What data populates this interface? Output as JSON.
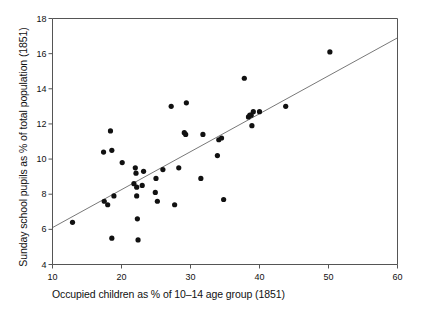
{
  "chart_data": {
    "type": "scatter",
    "title": "",
    "xlabel": "Occupied children as % of 10–14 age group (1851)",
    "ylabel": "Sunday school pupils as % of total population (1851)",
    "xlim": [
      10,
      60
    ],
    "ylim": [
      4,
      18
    ],
    "xticks": [
      10,
      20,
      30,
      40,
      50,
      60
    ],
    "yticks": [
      4,
      6,
      8,
      10,
      12,
      14,
      16,
      18
    ],
    "xticklabels": [
      "10",
      "20",
      "30",
      "40",
      "50",
      "60"
    ],
    "yticklabels": [
      "4",
      "6",
      "8",
      "10",
      "12",
      "14",
      "16",
      "18"
    ],
    "grid": false,
    "legend": null,
    "marker": "filled-circle",
    "marker_color": "#111111",
    "points": [
      {
        "x": 12.9,
        "y": 6.4
      },
      {
        "x": 17.4,
        "y": 10.4
      },
      {
        "x": 17.5,
        "y": 7.6
      },
      {
        "x": 18.0,
        "y": 7.4
      },
      {
        "x": 18.4,
        "y": 11.6
      },
      {
        "x": 18.6,
        "y": 10.5
      },
      {
        "x": 18.6,
        "y": 5.5
      },
      {
        "x": 18.9,
        "y": 7.9
      },
      {
        "x": 20.1,
        "y": 9.8
      },
      {
        "x": 21.8,
        "y": 8.6
      },
      {
        "x": 22.0,
        "y": 9.5
      },
      {
        "x": 22.1,
        "y": 9.2
      },
      {
        "x": 22.2,
        "y": 8.4
      },
      {
        "x": 22.2,
        "y": 7.9
      },
      {
        "x": 22.3,
        "y": 6.6
      },
      {
        "x": 22.4,
        "y": 5.4
      },
      {
        "x": 23.0,
        "y": 8.5
      },
      {
        "x": 23.2,
        "y": 9.3
      },
      {
        "x": 24.9,
        "y": 8.1
      },
      {
        "x": 25.0,
        "y": 8.9
      },
      {
        "x": 25.2,
        "y": 7.6
      },
      {
        "x": 26.0,
        "y": 9.4
      },
      {
        "x": 27.2,
        "y": 13.0
      },
      {
        "x": 27.7,
        "y": 7.4
      },
      {
        "x": 28.3,
        "y": 9.5
      },
      {
        "x": 29.1,
        "y": 11.5
      },
      {
        "x": 29.3,
        "y": 11.4
      },
      {
        "x": 29.4,
        "y": 13.2
      },
      {
        "x": 31.5,
        "y": 8.9
      },
      {
        "x": 31.8,
        "y": 11.4
      },
      {
        "x": 33.9,
        "y": 10.2
      },
      {
        "x": 34.1,
        "y": 11.1
      },
      {
        "x": 34.5,
        "y": 11.2
      },
      {
        "x": 34.8,
        "y": 7.7
      },
      {
        "x": 37.8,
        "y": 14.6
      },
      {
        "x": 38.4,
        "y": 12.4
      },
      {
        "x": 38.6,
        "y": 12.5
      },
      {
        "x": 38.8,
        "y": 12.5
      },
      {
        "x": 38.9,
        "y": 11.9
      },
      {
        "x": 39.1,
        "y": 12.7
      },
      {
        "x": 40.0,
        "y": 12.7
      },
      {
        "x": 43.8,
        "y": 13.0
      },
      {
        "x": 50.2,
        "y": 16.1
      }
    ],
    "fit_line": {
      "x1": 10,
      "y1": 6.1,
      "x2": 60,
      "y2": 16.9
    }
  }
}
